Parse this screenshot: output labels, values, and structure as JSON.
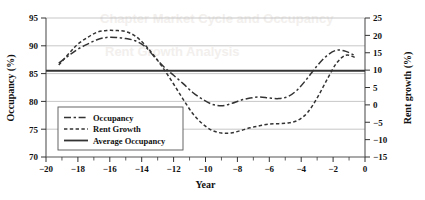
{
  "chart_data": {
    "type": "line",
    "title": "",
    "xlabel": "Year",
    "ylabel": "Occupancy (%)",
    "y2label": "Rent growth (%)",
    "xlim": [
      -20,
      0
    ],
    "ylim": [
      70,
      95
    ],
    "y2lim": [
      -15,
      25
    ],
    "grid": true,
    "legend_position": "lower-left-inside",
    "xticks": [
      -20,
      -18,
      -16,
      -14,
      -12,
      -10,
      -8,
      -6,
      -4,
      -2,
      0
    ],
    "xtick_labels": [
      "−20",
      "−18",
      "−16",
      "−14",
      "−12",
      "−10",
      "−8",
      "−6",
      "−4",
      "−2",
      "0"
    ],
    "xminor_ticks": [
      -19,
      -17,
      -15,
      -13,
      -11,
      -9,
      -7,
      -5,
      -3,
      -1
    ],
    "yticks": [
      70,
      75,
      80,
      85,
      90,
      95
    ],
    "ytick_labels": [
      "70",
      "75",
      "80",
      "85",
      "90",
      "95"
    ],
    "y2ticks": [
      -15,
      -10,
      -5,
      0,
      5,
      10,
      15,
      20,
      25
    ],
    "y2tick_labels": [
      "−15",
      "−10",
      "−5",
      "0",
      "5",
      "10",
      "15",
      "20",
      "25"
    ],
    "series": [
      {
        "name": "Occupancy",
        "axis": "left",
        "style": "long-dash-dot",
        "color": "#333333",
        "x": [
          -19.2,
          -18.5,
          -18.0,
          -17.4,
          -16.8,
          -16.2,
          -15.6,
          -15.0,
          -14.4,
          -13.8,
          -13.2,
          -12.6,
          -12.0,
          -11.4,
          -10.8,
          -10.2,
          -9.6,
          -9.0,
          -8.4,
          -7.8,
          -7.2,
          -6.6,
          -6.0,
          -5.4,
          -4.8,
          -4.2,
          -3.6,
          -3.0,
          -2.4,
          -1.8,
          -1.2,
          -0.6
        ],
        "values": [
          86.9,
          88.4,
          89.4,
          90.3,
          91.1,
          91.5,
          91.5,
          91.3,
          90.9,
          89.9,
          88.0,
          86.2,
          84.7,
          83.2,
          81.6,
          80.4,
          79.5,
          79.2,
          79.6,
          80.2,
          80.6,
          80.8,
          80.6,
          80.5,
          80.9,
          82.2,
          84.2,
          86.4,
          88.2,
          89.2,
          89.0,
          88.2
        ]
      },
      {
        "name": "Rent Growth",
        "axis": "right",
        "style": "short-dash",
        "color": "#333333",
        "x": [
          -19.2,
          -18.5,
          -18.0,
          -17.4,
          -16.8,
          -16.2,
          -15.6,
          -15.0,
          -14.4,
          -13.8,
          -13.2,
          -12.6,
          -12.0,
          -11.4,
          -10.8,
          -10.2,
          -9.6,
          -9.0,
          -8.4,
          -7.8,
          -7.2,
          -6.6,
          -6.0,
          -5.4,
          -4.8,
          -4.2,
          -3.6,
          -3.0,
          -2.4,
          -1.8,
          -1.2,
          -0.6
        ],
        "values": [
          11.5,
          15.1,
          17.5,
          19.4,
          20.9,
          21.4,
          21.4,
          21.1,
          19.8,
          17.3,
          14.0,
          10.2,
          6.0,
          1.6,
          -2.5,
          -5.4,
          -7.3,
          -8.1,
          -8.1,
          -7.4,
          -6.6,
          -6.0,
          -5.5,
          -5.4,
          -5.2,
          -4.4,
          -2.2,
          2.0,
          7.1,
          11.9,
          14.3,
          13.6
        ]
      },
      {
        "name": "Average Occupancy",
        "axis": "left",
        "style": "solid",
        "color": "#333333",
        "constant_value": 85.5
      }
    ],
    "legend_entries": [
      {
        "label": "Occupancy",
        "style": "long-dash-dot"
      },
      {
        "label": "Rent Growth",
        "style": "short-dash"
      },
      {
        "label": "Average Occupancy",
        "style": "solid"
      }
    ]
  },
  "axes": {
    "x_title": "Year",
    "y_left_title": "Occupancy (%)",
    "y_right_title": "Rent growth (%)"
  },
  "colors": {
    "line": "#333333",
    "grid": "#b9b9b9",
    "frame": "#555555",
    "text": "#111111",
    "background": "#ffffff"
  },
  "watermark": {
    "line1": "Chapter Market Cycle and Occupancy",
    "line2": "Rent Growth Analysis"
  }
}
